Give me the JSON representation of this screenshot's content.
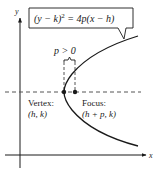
{
  "diagram": {
    "equation": "(y − k)² = 4p(x − h)",
    "equation_parts": {
      "lhs": "(y − k)",
      "exp": "2",
      "rhs": " = 4p(x − h)"
    },
    "condition_label": "p > 0",
    "vertex": {
      "label": "Vertex:",
      "coords": "(h, k)"
    },
    "focus": {
      "label": "Focus:",
      "coords": "(h + p, k)"
    },
    "axes": {
      "x_label": "x",
      "y_label": "y"
    },
    "colors": {
      "stroke": "#1a1a1a",
      "dashed": "#555555",
      "background": "#ffffff"
    }
  }
}
